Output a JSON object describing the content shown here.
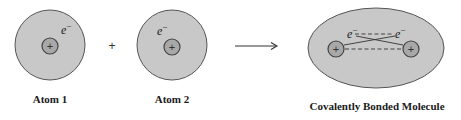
{
  "colors": {
    "atom_fill": "#c8c8c8",
    "atom_stroke": "#555555",
    "nucleus_fill": "#a8a8a8",
    "nucleus_stroke": "#444444",
    "line": "#333333"
  },
  "atom1": {
    "label": "Atom 1",
    "electron": "e",
    "electron_charge": "−",
    "nucleus_symbol": "+"
  },
  "operator": {
    "symbol": "+"
  },
  "atom2": {
    "label": "Atom 2",
    "electron": "e",
    "electron_charge": "−",
    "nucleus_symbol": "+"
  },
  "arrow": {
    "direction": "right"
  },
  "molecule": {
    "label": "Covalently Bonded Molecule",
    "electron_left": "e",
    "electron_right": "e",
    "electron_charge": "−",
    "nucleus_left_symbol": "+",
    "nucleus_right_symbol": "+"
  }
}
